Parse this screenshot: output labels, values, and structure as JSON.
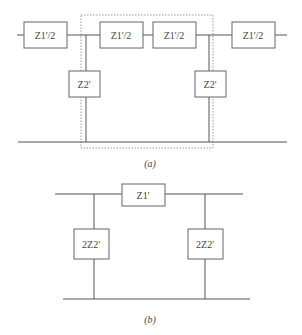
{
  "figure_a": {
    "caption": "(a)",
    "series_impedances": [
      {
        "label": "Z1'/2",
        "position": "left-outer"
      },
      {
        "label": "Z1'/2",
        "position": "inner-left"
      },
      {
        "label": "Z1'/2",
        "position": "inner-right"
      },
      {
        "label": "Z1'/2",
        "position": "right-outer"
      }
    ],
    "shunt_impedances": [
      {
        "label": "Z2'",
        "position": "left"
      },
      {
        "label": "Z2'",
        "position": "right"
      }
    ],
    "highlight": "dashed section boundary around one pi-section"
  },
  "figure_b": {
    "caption": "(b)",
    "series_impedances": [
      {
        "label": "Z1'",
        "position": "center"
      }
    ],
    "shunt_impedances": [
      {
        "label": "2Z2'",
        "position": "left"
      },
      {
        "label": "2Z2'",
        "position": "right"
      }
    ]
  }
}
